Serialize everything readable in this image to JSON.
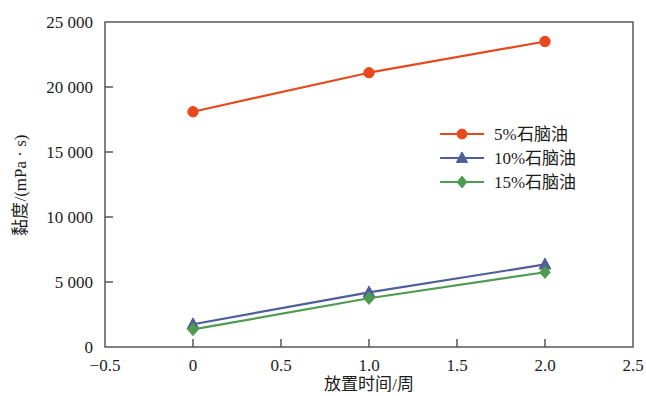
{
  "chart_data": {
    "type": "line",
    "title": "",
    "xlabel": "放置时间/周",
    "ylabel": "黏度/(mPa · s)",
    "xlim": [
      -0.5,
      2.5
    ],
    "ylim": [
      0,
      25000
    ],
    "grid": false,
    "legend_position": "center-right",
    "x": [
      0,
      1.0,
      2.0
    ],
    "xticks": [
      -0.5,
      0,
      0.5,
      1.0,
      1.5,
      2.0,
      2.5
    ],
    "xtick_labels": [
      "−0.5",
      "0",
      "0.5",
      "1.0",
      "1.5",
      "2.0",
      "2.5"
    ],
    "yticks": [
      0,
      5000,
      10000,
      15000,
      20000,
      25000
    ],
    "ytick_labels": [
      "0",
      "5 000",
      "10 000",
      "15 000",
      "20 000",
      "25 000"
    ],
    "series": [
      {
        "name": "5%石脑油",
        "color": "#E8491C",
        "marker": "circle",
        "values": [
          18100,
          21100,
          23500
        ]
      },
      {
        "name": "10%石脑油",
        "color": "#4F5D9B",
        "marker": "triangle",
        "values": [
          1750,
          4200,
          6350
        ]
      },
      {
        "name": "15%石脑油",
        "color": "#4E9B52",
        "marker": "diamond",
        "values": [
          1350,
          3750,
          5750
        ]
      }
    ]
  },
  "axes": {
    "frame_color": "#4d4d4d"
  }
}
